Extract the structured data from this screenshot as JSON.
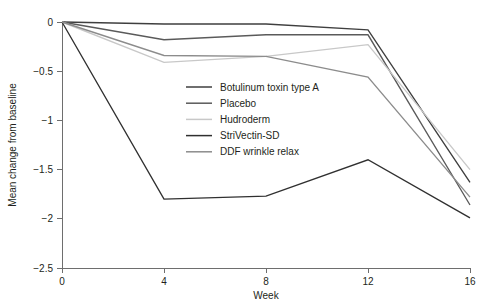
{
  "chart_data": {
    "type": "line",
    "title": "",
    "xlabel": "Week",
    "ylabel": "Mean change from baseline",
    "x": [
      0,
      4,
      8,
      12,
      16
    ],
    "xtick_labels": [
      "0",
      "4",
      "8",
      "12",
      "16"
    ],
    "ytick_labels": [
      "0",
      "−0.5",
      "−1",
      "−1.5",
      "−2",
      "−2.5"
    ],
    "yticks": [
      0,
      -0.5,
      -1,
      -1.5,
      -2,
      -2.5
    ],
    "xlim": [
      0,
      16
    ],
    "ylim": [
      -2.5,
      0
    ],
    "grid": false,
    "legend_position": "inside-upper-center",
    "series": [
      {
        "name": "Botulinum toxin type A",
        "values": [
          0,
          -0.02,
          -0.02,
          -0.08,
          -1.63
        ],
        "color": "#3f3f3f"
      },
      {
        "name": "Placebo",
        "values": [
          0,
          -0.18,
          -0.13,
          -0.13,
          -1.86
        ],
        "color": "#5a5a5a"
      },
      {
        "name": "Hudroderm",
        "values": [
          0,
          -0.41,
          -0.35,
          -0.23,
          -1.5
        ],
        "color": "#c8c8c8"
      },
      {
        "name": "StriVectin-SD",
        "values": [
          0,
          -1.8,
          -1.77,
          -1.4,
          -1.99
        ],
        "color": "#303030"
      },
      {
        "name": "DDF wrinkle relax",
        "values": [
          0,
          -0.34,
          -0.35,
          -0.56,
          -1.78
        ],
        "color": "#8c8c8c"
      }
    ]
  },
  "axes": {
    "x_title": "Week",
    "y_title": "Mean change from baseline"
  },
  "legend": {
    "items": [
      {
        "label": "Botulinum toxin type A"
      },
      {
        "label": "Placebo"
      },
      {
        "label": "Hudroderm"
      },
      {
        "label": "StriVectin-SD"
      },
      {
        "label": "DDF wrinkle relax"
      }
    ]
  }
}
